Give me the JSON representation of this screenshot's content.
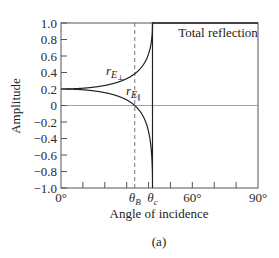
{
  "chart_data": {
    "type": "line",
    "title": "",
    "xlabel": "Angle of incidence",
    "ylabel": "Amplitude",
    "caption": "(a)",
    "xlim": [
      0,
      90
    ],
    "ylim": [
      -1.0,
      1.0
    ],
    "grid": false,
    "legend": "none (curves labeled inline)",
    "ytick_labels": [
      "1.0",
      "0.8",
      "0.6",
      "0.4",
      "0.2",
      "0",
      "−0.2",
      "−0.4",
      "−0.6",
      "−0.8",
      "−1.0"
    ],
    "ytick_values": [
      1.0,
      0.8,
      0.6,
      0.4,
      0.2,
      0,
      -0.2,
      -0.4,
      -0.6,
      -0.8,
      -1.0
    ],
    "xtick_values": [
      0,
      10,
      20,
      30,
      40,
      50,
      60,
      70,
      80,
      90
    ],
    "xtick_labels": [
      {
        "value": 0,
        "text": "0°"
      },
      {
        "value": 33.7,
        "text": "θ",
        "sub": "B"
      },
      {
        "value": 41.8,
        "text": "θ",
        "sub": "c"
      },
      {
        "value": 60,
        "text": "60°"
      },
      {
        "value": 90,
        "text": "90°"
      }
    ],
    "reference_lines": [
      {
        "type": "vertical-dashed",
        "x": 33.7,
        "name": "Brewster angle θB"
      },
      {
        "type": "vertical-dashed",
        "x": 41.8,
        "name": "critical angle θc"
      },
      {
        "type": "horizontal",
        "y": 0
      }
    ],
    "annotations": [
      {
        "text": "Total reflection",
        "x": 66,
        "y": 0.95
      }
    ],
    "series": [
      {
        "name": "r_E⊥",
        "label_main": "r",
        "label_sub": "E",
        "label_subsub": "⊥",
        "x": [
          0,
          10,
          20,
          30,
          35,
          38,
          40,
          41,
          41.5,
          41.8,
          45,
          60,
          90
        ],
        "values": [
          0.2,
          0.21,
          0.243,
          0.326,
          0.413,
          0.51,
          0.625,
          0.728,
          0.823,
          1.0,
          1.0,
          1.0,
          1.0
        ]
      },
      {
        "name": "r_E∥",
        "label_main": "r",
        "label_sub": "E",
        "label_subsub": "∥",
        "x": [
          0,
          10,
          20,
          30,
          33.7,
          35,
          38,
          40,
          41,
          41.5,
          41.8,
          45,
          60,
          90
        ],
        "values": [
          0.2,
          0.19,
          0.156,
          0.068,
          0.0,
          -0.034,
          -0.155,
          -0.316,
          -0.477,
          -0.639,
          -1.0,
          1.0,
          1.0,
          1.0
        ]
      }
    ],
    "physics": {
      "n1": 1.5,
      "n2": 1.0,
      "brewster_deg": 33.7,
      "critical_deg": 41.8
    }
  }
}
